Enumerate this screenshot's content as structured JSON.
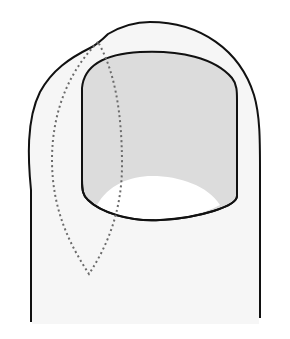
{
  "diagram": {
    "colors": {
      "background": "#ffffff",
      "skin_fill": "#f6f6f6",
      "nail_fill": "#dcdcdc",
      "lunula_fill": "#ffffff",
      "outline": "#111111",
      "excision_dots": "#6b6b6b"
    },
    "elements": {
      "toe_outline": "toe-outline",
      "nail_plate": "nail-plate",
      "lunula": "lunula",
      "excision_region": "dotted-excision-outline"
    }
  }
}
